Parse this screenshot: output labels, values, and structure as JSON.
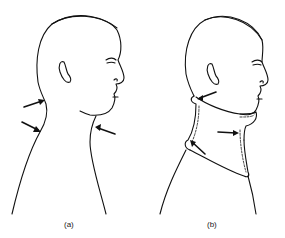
{
  "figure": {
    "panels": [
      {
        "id": "a",
        "label": "(a)",
        "description": "Head and neck profile with arrows indicating neck contour points"
      },
      {
        "id": "b",
        "label": "(b)",
        "description": "Head and neck profile wearing cervical collar with arrows indicating pressure points"
      }
    ],
    "colors": {
      "line": "#111111",
      "background": "#ffffff"
    }
  }
}
